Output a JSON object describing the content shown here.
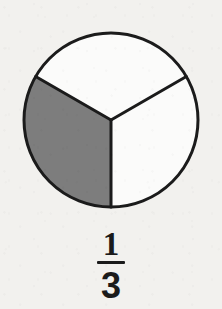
{
  "figure": {
    "name": "fraction-circle-one-third",
    "background_color": "#f2f1ee",
    "outline_color": "#1b1b1b",
    "shaded_color": "#7d7d7d",
    "unshaded_color": "#fbfbfa",
    "outline_width": 3
  },
  "circle": {
    "center_x": 111,
    "center_y": 120,
    "radius": 87,
    "total_parts": 3,
    "shaded_parts": 1
  },
  "sectors": [
    {
      "id": "sector-shaded-left",
      "label": "shaded",
      "start_angle_deg": 90,
      "end_angle_deg": 210,
      "shaded": true,
      "fill": "#7d7d7d"
    },
    {
      "id": "sector-top",
      "label": "unshaded",
      "start_angle_deg": 210,
      "end_angle_deg": 330,
      "shaded": false,
      "fill": "#fbfbfa"
    },
    {
      "id": "sector-right",
      "label": "unshaded",
      "start_angle_deg": 330,
      "end_angle_deg": 90,
      "shaded": false,
      "fill": "#fbfbfa"
    }
  ],
  "fraction": {
    "numerator": "1",
    "denominator": "3",
    "text": "1/3"
  },
  "chart_data": {
    "type": "pie",
    "title": "",
    "categories": [
      "shaded",
      "unshaded",
      "unshaded"
    ],
    "values": [
      1,
      1,
      1
    ],
    "labels": [
      "1/3",
      "1/3",
      "1/3"
    ],
    "colors": [
      "#7d7d7d",
      "#fbfbfa",
      "#fbfbfa"
    ],
    "annotations": [
      "1/3"
    ],
    "legend": "none"
  }
}
